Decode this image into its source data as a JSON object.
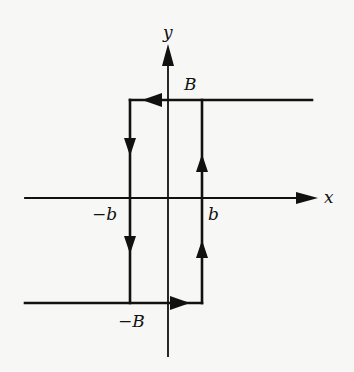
{
  "diagram": {
    "type": "hysteresis-loop",
    "axes": {
      "x_label": "x",
      "y_label": "y"
    },
    "labels": {
      "upper_level": "B",
      "lower_level": "−B",
      "left_threshold": "−b",
      "right_threshold": "b"
    },
    "colors": {
      "ink": "#111111",
      "background": "#f7f7f6"
    },
    "paths": [
      {
        "name": "upper-branch",
        "from": "x=+inf",
        "to": "x=-b",
        "level": "B",
        "direction": "leftward"
      },
      {
        "name": "left-drop",
        "at": "x=-b",
        "from": "B",
        "to": "-B",
        "direction": "downward"
      },
      {
        "name": "lower-branch",
        "from": "x=-inf",
        "to": "x=b",
        "level": "-B",
        "direction": "rightward"
      },
      {
        "name": "right-rise",
        "at": "x=b",
        "from": "-B",
        "to": "B",
        "direction": "upward"
      }
    ]
  }
}
